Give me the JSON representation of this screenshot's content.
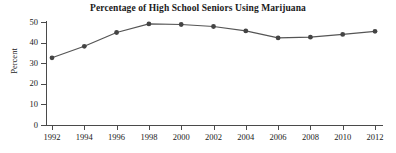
{
  "chart_data": {
    "type": "line",
    "title": "Percentage of High School Seniors Using Marijuana",
    "xlabel": "",
    "ylabel": "Percent",
    "x": [
      1992,
      1994,
      1996,
      1998,
      2000,
      2002,
      2004,
      2006,
      2008,
      2010,
      2012
    ],
    "categories": [
      "1992",
      "1994",
      "1996",
      "1998",
      "2000",
      "2002",
      "2004",
      "2006",
      "2008",
      "2010",
      "2012"
    ],
    "values": [
      32.6,
      38.2,
      44.9,
      49.1,
      48.8,
      47.8,
      45.7,
      42.3,
      42.6,
      44.0,
      45.5
    ],
    "series": [
      {
        "name": "Percent using marijuana",
        "values": [
          32.6,
          38.2,
          44.9,
          49.1,
          48.8,
          47.8,
          45.7,
          42.3,
          42.6,
          44.0,
          45.5
        ]
      }
    ],
    "ylim": [
      0,
      50
    ],
    "xlim": [
      1992,
      2012
    ],
    "y_ticks": [
      "0",
      "10",
      "20",
      "30",
      "40",
      "50"
    ],
    "y_tick_values": [
      0,
      10,
      20,
      30,
      40,
      50
    ],
    "x_ticks": [
      "1992",
      "1994",
      "1996",
      "1998",
      "2000",
      "2002",
      "2004",
      "2006",
      "2008",
      "2010",
      "2012"
    ],
    "grid": false,
    "legend": false,
    "legend_position": "none",
    "marker": "circle",
    "line_color": "#555555",
    "marker_color": "#444444",
    "axis_color": "#4a4a4a",
    "text_color": "#1a1a1a",
    "background_color": "#ffffff"
  },
  "axes": {
    "y_title": "Percent"
  }
}
